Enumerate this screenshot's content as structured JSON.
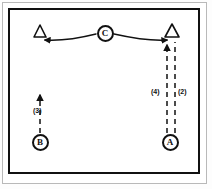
{
  "figure": {
    "kind": "node-link-diagram",
    "background_color": "#ffffff",
    "ink_color": "#111111",
    "outer_border_color": "#b9b9b9"
  },
  "nodes": [
    {
      "id": "C",
      "label": "C",
      "shape": "circle",
      "x": 105,
      "y": 33
    },
    {
      "id": "B",
      "label": "B",
      "shape": "circle",
      "x": 40,
      "y": 142
    },
    {
      "id": "A",
      "label": "A",
      "shape": "circle",
      "x": 170,
      "y": 142
    }
  ],
  "terminals": [
    {
      "id": "T-left",
      "shape": "triangle",
      "filled": false,
      "x": 40,
      "y": 33
    },
    {
      "id": "T-right",
      "shape": "triangle",
      "filled": false,
      "x": 172,
      "y": 33
    }
  ],
  "edges": [
    {
      "id": "edge-c-left",
      "from": "C",
      "to": "T-left",
      "style": "solid",
      "curved": true,
      "arrowhead": "to",
      "label": ""
    },
    {
      "id": "edge-c-right",
      "from": "C",
      "to": "T-right",
      "style": "solid",
      "curved": true,
      "arrowhead": "to",
      "label": ""
    },
    {
      "id": "edge-b-up",
      "from": "B",
      "to": "up",
      "style": "dashed",
      "curved": false,
      "arrowhead": "to",
      "label": "(3)"
    },
    {
      "id": "edge-a-up-left",
      "from": "A",
      "to": "T-right",
      "style": "dashed",
      "curved": false,
      "arrowhead": "to",
      "label": "(4)"
    },
    {
      "id": "edge-a-up-right",
      "from": "A",
      "to": "T-right",
      "style": "dashed",
      "curved": false,
      "arrowhead": "none",
      "label": "(2)"
    }
  ],
  "labels": {
    "b_branch": "(3)",
    "a_branch_left": "(4)",
    "a_branch_right": "(2)"
  }
}
